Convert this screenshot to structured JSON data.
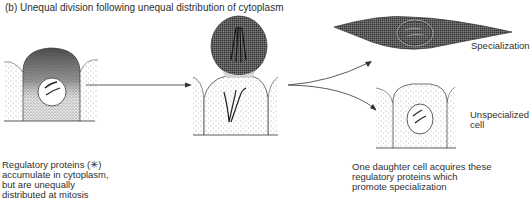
{
  "title": "(b) Unequal division following unequal distribution of cytoplasm",
  "captions": {
    "left": {
      "lines": [
        "Regulatory proteins (✳)",
        "accumulate in cytoplasm,",
        "but are unequally",
        "distributed at mitosis"
      ]
    },
    "right": {
      "lines": [
        "One daughter cell acquires these",
        "regulatory proteins which",
        "promote specialization"
      ]
    }
  },
  "labels": {
    "specialization": "Specialization",
    "unspecialized": [
      "Unspecialized",
      "cell"
    ]
  },
  "colors": {
    "ink": "#2a2a2a",
    "stipple_dark": "#3a3a3a",
    "background": "#ffffff"
  },
  "stages": [
    {
      "name": "interphase-cell",
      "description": "Epithelial cell with regulatory proteins concentrated in apical cytoplasm; nucleus with chromosomes"
    },
    {
      "name": "dividing-cell",
      "description": "Cell in mitosis with dark apical daughter bulging out; spindle fibres"
    },
    {
      "name": "specialized-cell",
      "description": "Elongated spindle-shaped dark cell containing nucleus"
    },
    {
      "name": "unspecialized-cell",
      "description": "Light epithelial cell with nucleus"
    }
  ]
}
